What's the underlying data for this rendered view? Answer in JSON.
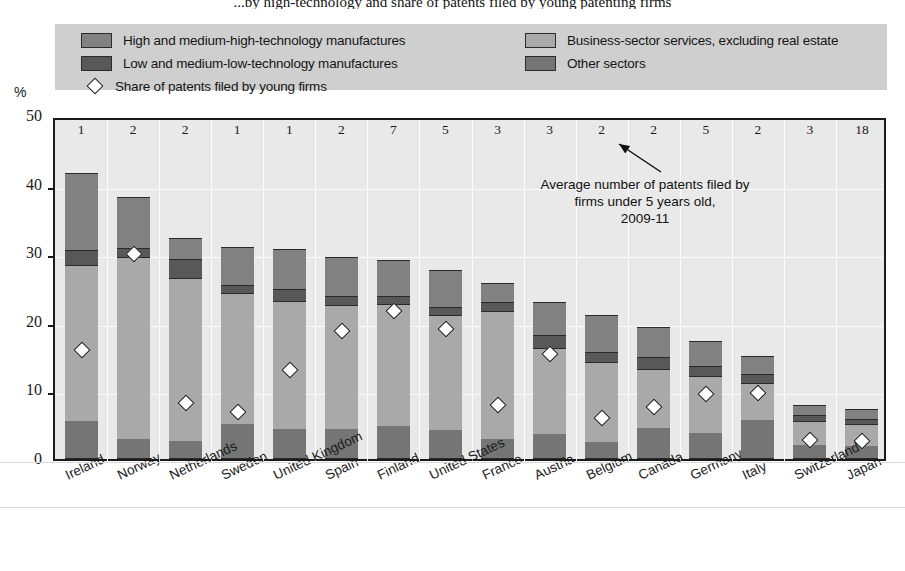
{
  "title": "...by high-technology and share of patents filed by young patenting firms",
  "axis": {
    "unit_label": "%",
    "y_ticks": [
      "0",
      "10",
      "20",
      "30",
      "40",
      "50"
    ]
  },
  "legend": {
    "left": [
      {
        "icon": "swatch-high-tech",
        "label": "High and medium-high-technology manufactures",
        "color": "#818181"
      },
      {
        "icon": "swatch-low-tech",
        "label": "Low and medium-low-technology manufactures",
        "color": "#585858"
      },
      {
        "icon": "diamond-marker",
        "label": "Share of patents filed by young firms",
        "color": "#ffffff"
      }
    ],
    "right": [
      {
        "icon": "swatch-business-services",
        "label": "Business-sector services, excluding real estate",
        "color": "#a9a9a9"
      },
      {
        "icon": "swatch-other-sectors",
        "label": "Other sectors",
        "color": "#757575"
      }
    ]
  },
  "annotation": {
    "line1": "Average number of patents filed by",
    "line2": "firms under 5 years old,",
    "line3": "2009-11"
  },
  "chart_data": {
    "type": "bar",
    "title": "...by high-technology and share of patents filed by young patenting firms",
    "xlabel": "",
    "ylabel": "%",
    "ylim": [
      0,
      50
    ],
    "grid": true,
    "legend_position": "top",
    "stacked": true,
    "categories": [
      "Ireland",
      "Norway",
      "Netherlands",
      "Sweden",
      "United Kingdom",
      "Spain",
      "Finland",
      "United States",
      "France",
      "Austria",
      "Belgium",
      "Canada",
      "Germany",
      "Italy",
      "Switzerland",
      "Japan"
    ],
    "series": [
      {
        "name": "Other sectors",
        "values": [
          5.4,
          2.7,
          2.5,
          4.9,
          4.2,
          4.2,
          4.7,
          4.1,
          2.8,
          3.5,
          2.4,
          4.4,
          3.6,
          5.6,
          1.9,
          1.8
        ]
      },
      {
        "name": "Business-sector services, excluding real estate",
        "values": [
          22.8,
          26.6,
          23.8,
          19.1,
          18.7,
          18.1,
          17.8,
          16.8,
          18.6,
          12.6,
          11.6,
          8.6,
          8.4,
          5.3,
          3.5,
          3.2
        ]
      },
      {
        "name": "Low and medium-low-technology manufactures",
        "values": [
          2.1,
          1.3,
          2.7,
          1.2,
          1.7,
          1.3,
          1.1,
          1.1,
          1.3,
          1.9,
          1.4,
          1.7,
          1.4,
          1.3,
          0.9,
          0.7
        ]
      },
      {
        "name": "High and medium-high-technology manufactures",
        "values": [
          11.2,
          7.4,
          3.0,
          5.6,
          5.9,
          5.7,
          5.2,
          5.4,
          2.8,
          4.7,
          5.5,
          4.4,
          3.7,
          2.7,
          1.4,
          1.5
        ]
      }
    ],
    "marker_series": {
      "name": "Share of patents filed by young firms",
      "values": [
        16.6,
        30.6,
        8.8,
        7.5,
        13.7,
        19.3,
        22.2,
        19.6,
        8.5,
        16.0,
        6.7,
        8.3,
        10.1,
        10.3,
        3.4,
        3.3
      ]
    },
    "top_labels": {
      "description": "Average number of patents filed by firms under 5 years old, 2009-11",
      "values": [
        "1",
        "2",
        "2",
        "1",
        "1",
        "2",
        "7",
        "5",
        "3",
        "3",
        "2",
        "2",
        "5",
        "2",
        "3",
        "18"
      ]
    }
  }
}
